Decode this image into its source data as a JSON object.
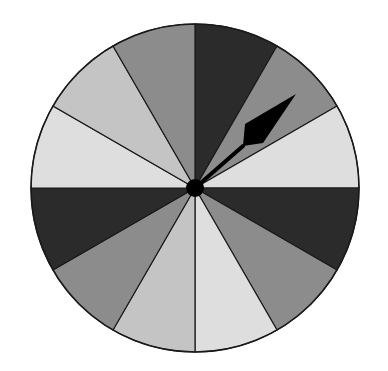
{
  "spinner": {
    "center": [
      195,
      188
    ],
    "radius": 164,
    "slice_count": 12,
    "slice_angle_deg": 30,
    "outline_color": "#1a1a1a",
    "slices": [
      {
        "index": 0,
        "start_deg": 0,
        "end_deg": 30,
        "shade": "dark",
        "color": "#2b2b2b"
      },
      {
        "index": 1,
        "start_deg": 30,
        "end_deg": 60,
        "shade": "medium",
        "color": "#8c8c8c"
      },
      {
        "index": 2,
        "start_deg": 60,
        "end_deg": 90,
        "shade": "very-light",
        "color": "#dedede"
      },
      {
        "index": 3,
        "start_deg": 90,
        "end_deg": 120,
        "shade": "dark",
        "color": "#2b2b2b"
      },
      {
        "index": 4,
        "start_deg": 120,
        "end_deg": 150,
        "shade": "medium",
        "color": "#8c8c8c"
      },
      {
        "index": 5,
        "start_deg": 150,
        "end_deg": 180,
        "shade": "very-light",
        "color": "#dedede"
      },
      {
        "index": 6,
        "start_deg": 180,
        "end_deg": 210,
        "shade": "light",
        "color": "#c4c4c4"
      },
      {
        "index": 7,
        "start_deg": 210,
        "end_deg": 240,
        "shade": "medium",
        "color": "#8c8c8c"
      },
      {
        "index": 8,
        "start_deg": 240,
        "end_deg": 270,
        "shade": "dark",
        "color": "#2b2b2b"
      },
      {
        "index": 9,
        "start_deg": 270,
        "end_deg": 300,
        "shade": "very-light",
        "color": "#dedede"
      },
      {
        "index": 10,
        "start_deg": 300,
        "end_deg": 330,
        "shade": "light",
        "color": "#c4c4c4"
      },
      {
        "index": 11,
        "start_deg": 330,
        "end_deg": 360,
        "shade": "medium",
        "color": "#8c8c8c"
      }
    ],
    "pointer": {
      "angle_deg": 50,
      "color": "#000000",
      "tip": [
        296,
        94
      ],
      "head_back": [
        243,
        146
      ],
      "head_side_a": [
        245,
        124
      ],
      "head_side_b": [
        263,
        143
      ],
      "hub_radius": 9
    }
  }
}
